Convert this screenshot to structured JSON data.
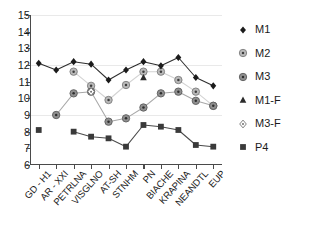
{
  "chart_data": {
    "type": "line",
    "title": "",
    "xlabel": "",
    "ylabel": "",
    "ylim": [
      6,
      15
    ],
    "yticks": [
      6,
      7,
      8,
      9,
      10,
      11,
      12,
      13,
      14,
      15
    ],
    "grid": "horizontal-faint-at-9-12-15",
    "legend_position": "right",
    "categories": [
      "GD - H1",
      "AR - XXI",
      "PETRLNA",
      "VISGLNO",
      "AT-SH",
      "STNHM",
      "PN",
      "BIACHE",
      "KRAPINA",
      "NEANDTL",
      "EUP"
    ],
    "series": [
      {
        "name": "M1",
        "marker": "filled-diamond",
        "color": "#1b1b1b",
        "line_color": "#2e2e2e",
        "values": [
          12.1,
          11.7,
          12.2,
          12.05,
          11.1,
          11.7,
          12.2,
          11.95,
          12.45,
          11.25,
          10.75
        ]
      },
      {
        "name": "M2",
        "marker": "circle-dot-light",
        "color": "#8d8d8d",
        "line_color": "#d2d2d2",
        "values": [
          null,
          null,
          11.6,
          10.75,
          9.9,
          10.8,
          11.6,
          11.6,
          11.1,
          10.4,
          9.55
        ]
      },
      {
        "name": "M3",
        "marker": "circle-dot-gray",
        "color": "#707070",
        "line_color": "#a8a8a8",
        "values": [
          null,
          9.0,
          10.3,
          10.4,
          8.6,
          8.8,
          9.45,
          10.3,
          10.4,
          9.85,
          9.55
        ]
      },
      {
        "name": "M1-F",
        "marker": "filled-triangle",
        "color": "#2b2b2b",
        "line_color": "none",
        "values": [
          null,
          null,
          null,
          null,
          null,
          null,
          11.25,
          null,
          null,
          null,
          null
        ]
      },
      {
        "name": "M3-F",
        "marker": "open-diamond",
        "color": "#8a8a8a",
        "line_color": "none",
        "values": [
          null,
          null,
          null,
          10.4,
          null,
          null,
          null,
          null,
          null,
          null,
          null
        ]
      },
      {
        "name": "P4",
        "marker": "filled-square",
        "color": "#3a3a3a",
        "line_color": "#4a4a4a",
        "values": [
          8.1,
          null,
          8.0,
          7.7,
          7.6,
          7.1,
          8.4,
          8.3,
          8.1,
          7.2,
          7.1
        ]
      }
    ]
  },
  "legend": {
    "items": [
      {
        "label": "M1",
        "marker": "filled-diamond"
      },
      {
        "label": "M2",
        "marker": "circle-dot-light"
      },
      {
        "label": "M3",
        "marker": "circle-dot-gray"
      },
      {
        "label": "M1-F",
        "marker": "filled-triangle"
      },
      {
        "label": "M3-F",
        "marker": "open-diamond"
      },
      {
        "label": "P4",
        "marker": "filled-square"
      }
    ]
  },
  "colors": {
    "axis": "#4a4a4a",
    "grid": "#e9e9e9",
    "text": "#1b1b1b",
    "background": "#ffffff"
  }
}
